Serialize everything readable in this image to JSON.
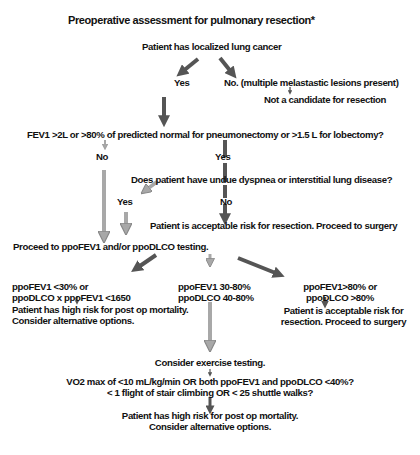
{
  "title": "Preoperative assessment for pulmonary resection*",
  "nodes": {
    "start": "Patient has localized lung cancer",
    "yes1": "Yes",
    "no1": "No. (multiple melastastic lesions present)",
    "not_candidate": "Not a candidate for resection",
    "fev1_question": "FEV1 >2L or >80% of predicted normal for pneumonectomy or >1.5 L for lobectomy?",
    "no2": "No",
    "yes2": "Yes",
    "dyspnea_question": "Does patient have undue dyspnea or interstitial lung disease?",
    "yes3": "Yes",
    "no3": "No",
    "acceptable1": "Patient is acceptable risk for resection. Proceed to surgery",
    "ppo_testing": "Proceed to ppoFEV1 and/or ppoDLCO testing.",
    "low_line1": "ppoFEV1 <30% or",
    "low_line2": "ppoDLCO x ppoFEV1 <1650",
    "mid_line1": "ppoFEV1 30-80%",
    "mid_line2": "ppoDLCO 40-80%",
    "high_line1": "ppoFEV1>80% or",
    "high_line2": "ppoDLCO >80%",
    "high_risk1_line1": "Patient has high risk for post op mortality.",
    "high_risk1_line2": "Consider alternative options.",
    "acceptable2_line1": "Patient is acceptable risk for",
    "acceptable2_line2": "resection. Proceed to surgery",
    "exercise": "Consider exercise testing.",
    "vo2_line1": "VO2 max of <10 mL/kg/min OR both ppoFEV1 and ppoDLCO <40%?",
    "vo2_line2": "< 1 flight of stair climbing OR < 25 shuttle walks?",
    "high_risk2_line1": "Patient has high risk for post op mortality.",
    "high_risk2_line2": "Consider alternative options."
  },
  "colors": {
    "dark_arrow": "#555555",
    "light_arrow": "#a8a8a8",
    "text": "#111111"
  }
}
